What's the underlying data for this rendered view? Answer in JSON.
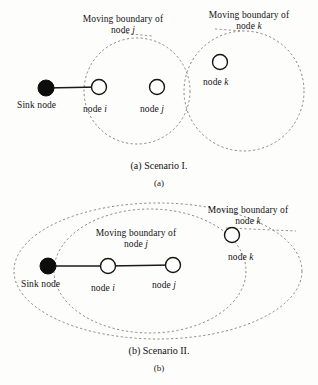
{
  "figure": {
    "background_color": "#fdfdfc",
    "stroke_color": "#1a1a1a",
    "dashed_color": "#5a5a5a",
    "sink_fill": "#0d0d0d",
    "node_fill": "#ffffff"
  },
  "scenario_a": {
    "boundary_j": {
      "line1": "Moving boundary of",
      "line2_prefix": "node",
      "line2_symbol": "j"
    },
    "boundary_k": {
      "line1": "Moving boundary of",
      "line2_prefix": "node",
      "line2_symbol": "k"
    },
    "nodes": [
      {
        "id": "sink",
        "label_prefix": "Sink node",
        "label_symbol": "",
        "type": "filled"
      },
      {
        "id": "node-i",
        "label_prefix": "node",
        "label_symbol": "i",
        "type": "open"
      },
      {
        "id": "node-j",
        "label_prefix": "node",
        "label_symbol": "j",
        "type": "open"
      },
      {
        "id": "node-k",
        "label_prefix": "node",
        "label_symbol": "k",
        "type": "open"
      }
    ],
    "caption": "(a) Scenario I.",
    "subcaption": "(a)"
  },
  "scenario_b": {
    "boundary_j": {
      "line1": "Moving boundary of",
      "line2_prefix": "node",
      "line2_symbol": "j"
    },
    "boundary_k": {
      "line1": "Moving boundary of",
      "line2_prefix": "node",
      "line2_symbol": "k"
    },
    "nodes": [
      {
        "id": "sink",
        "label_prefix": "Sink node",
        "label_symbol": "",
        "type": "filled"
      },
      {
        "id": "node-i",
        "label_prefix": "node",
        "label_symbol": "i",
        "type": "open"
      },
      {
        "id": "node-j",
        "label_prefix": "node",
        "label_symbol": "j",
        "type": "open"
      },
      {
        "id": "node-k",
        "label_prefix": "node",
        "label_symbol": "k",
        "type": "open"
      }
    ],
    "caption": "(b) Scenario II.",
    "subcaption": "(b)"
  }
}
